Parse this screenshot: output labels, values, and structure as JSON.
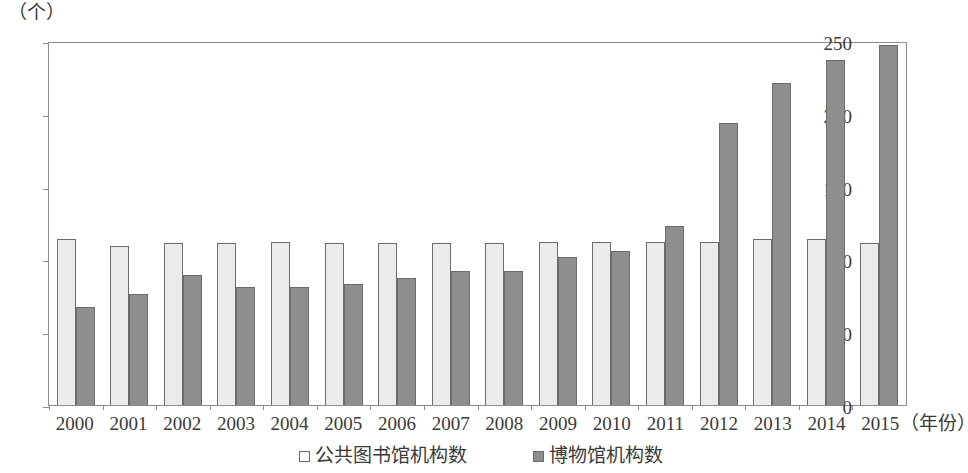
{
  "chart_data": {
    "type": "bar",
    "title": "",
    "subtitle": "",
    "xlabel": "（年份）",
    "ylabel": "（个）",
    "ylim": [
      0,
      250
    ],
    "ytick_labels": [
      "250",
      "200",
      "150",
      "100",
      "50",
      "0"
    ],
    "ytick_values": [
      250,
      200,
      150,
      100,
      50,
      0
    ],
    "grid": false,
    "legend_position": "bottom-center",
    "categories": [
      "2000",
      "2001",
      "2002",
      "2003",
      "2004",
      "2005",
      "2006",
      "2007",
      "2008",
      "2009",
      "2010",
      "2011",
      "2012",
      "2013",
      "2014",
      "2015"
    ],
    "series": [
      {
        "name": "公共图书馆机构数",
        "color": "#ebebeb",
        "values": [
          114,
          109,
          111,
          111,
          112,
          111,
          111,
          111,
          111,
          112,
          112,
          112,
          112,
          114,
          114,
          111
        ]
      },
      {
        "name": "博物馆机构数",
        "color": "#8e8e8e",
        "values": [
          67,
          76,
          89,
          81,
          81,
          83,
          87,
          92,
          92,
          102,
          106,
          123,
          194,
          221,
          237,
          247
        ]
      }
    ]
  },
  "legend": {
    "items": [
      {
        "label": "公共图书馆机构数",
        "swatch": "light"
      },
      {
        "label": "博物馆机构数",
        "swatch": "dark"
      }
    ]
  }
}
